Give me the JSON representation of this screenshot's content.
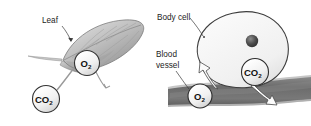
{
  "figure": {
    "background_color": "#ffffff",
    "width": 311,
    "height": 126
  },
  "panels": [
    {
      "id": "leaf-panel",
      "name": "Leaf gas exchange",
      "labels": [
        {
          "name": "leaf-label",
          "text": "Leaf"
        }
      ],
      "molecules": [
        {
          "name": "oxygen-bubble",
          "formula": "O",
          "subscript": "2",
          "direction": "out"
        },
        {
          "name": "carbon-dioxide-bubble",
          "formula": "CO",
          "subscript": "2",
          "direction": "in"
        }
      ],
      "colors": {
        "leaf_light": "#dcdcdc",
        "leaf_mid": "#b4b4b4",
        "leaf_dark": "#8a8a8a",
        "outline": "#5a5a5a"
      }
    },
    {
      "id": "body-cell-panel",
      "name": "Body cell gas exchange",
      "labels": [
        {
          "name": "body-cell-label",
          "text": "Body cell"
        },
        {
          "name": "blood-vessel-label-line1",
          "text": "Blood"
        },
        {
          "name": "blood-vessel-label-line2",
          "text": "vessel"
        }
      ],
      "molecules": [
        {
          "name": "oxygen-bubble",
          "formula": "O",
          "subscript": "2",
          "direction": "in"
        },
        {
          "name": "carbon-dioxide-bubble",
          "formula": "CO",
          "subscript": "2",
          "direction": "out"
        }
      ],
      "parts": [
        {
          "name": "nucleus",
          "shape": "circle"
        },
        {
          "name": "blood-vessel",
          "shape": "band"
        }
      ],
      "colors": {
        "cell_fill": "#f3f3f3",
        "cell_outline": "#3d3d3d",
        "nucleus": "#4a4a4a",
        "vessel_dark": "#6e6e6e",
        "vessel_wall": "#bdbdbd"
      }
    }
  ],
  "bubble_style": {
    "fill": "#f2f2f2",
    "outline": "#3a3a3a",
    "text_color": "#121212"
  }
}
